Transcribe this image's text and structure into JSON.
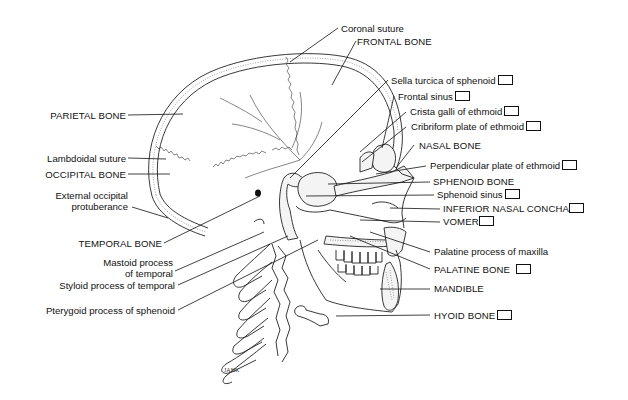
{
  "diagram": {
    "colors": {
      "ink": "#111111",
      "background": "#ffffff"
    },
    "labels_left": [
      {
        "id": "parietal",
        "text": "PARIETAL BONE",
        "caps": true,
        "checkbox": false
      },
      {
        "id": "lambdoidal",
        "text": "Lambdoidal suture",
        "caps": false,
        "checkbox": false
      },
      {
        "id": "occipital",
        "text": "OCCIPITAL BONE",
        "caps": true,
        "checkbox": false
      },
      {
        "id": "ext_occ_1",
        "text": "External occipital",
        "caps": false,
        "checkbox": false
      },
      {
        "id": "ext_occ_2",
        "text": "protuberance",
        "caps": false,
        "checkbox": false
      },
      {
        "id": "temporal",
        "text": "TEMPORAL BONE",
        "caps": true,
        "checkbox": false
      },
      {
        "id": "mastoid_1",
        "text": "Mastoid process",
        "caps": false,
        "checkbox": false
      },
      {
        "id": "mastoid_2",
        "text": "of temporal",
        "caps": false,
        "checkbox": false
      },
      {
        "id": "styloid",
        "text": "Styloid process of temporal",
        "caps": false,
        "checkbox": false
      },
      {
        "id": "pterygoid",
        "text": "Pterygoid process of sphenoid",
        "caps": false,
        "checkbox": false
      }
    ],
    "labels_right": [
      {
        "id": "coronal",
        "text": "Coronal suture",
        "caps": false,
        "checkbox": false
      },
      {
        "id": "frontal",
        "text": "FRONTAL BONE",
        "caps": true,
        "checkbox": false
      },
      {
        "id": "sella",
        "text": "Sella turcica of sphenoid",
        "caps": false,
        "checkbox": true
      },
      {
        "id": "frontal_sinus",
        "text": "Frontal sinus",
        "caps": false,
        "checkbox": true
      },
      {
        "id": "crista",
        "text": "Crista galli of ethmoid",
        "caps": false,
        "checkbox": true
      },
      {
        "id": "cribriform",
        "text": "Cribriform plate of ethmoid",
        "caps": false,
        "checkbox": true
      },
      {
        "id": "nasal",
        "text": "NASAL BONE",
        "caps": true,
        "checkbox": false
      },
      {
        "id": "perpendicular",
        "text": "Perpendicular plate of ethmoid",
        "caps": false,
        "checkbox": true
      },
      {
        "id": "sphenoid",
        "text": "SPHENOID BONE",
        "caps": true,
        "checkbox": false
      },
      {
        "id": "sphenoid_sinus",
        "text": "Sphenoid sinus",
        "caps": false,
        "checkbox": true
      },
      {
        "id": "concha",
        "text": "INFERIOR NASAL CONCHA",
        "caps": true,
        "checkbox": true
      },
      {
        "id": "vomer",
        "text": "VOMER",
        "caps": true,
        "checkbox": true
      },
      {
        "id": "palatine_process",
        "text": "Palatine process of maxilla",
        "caps": false,
        "checkbox": false
      },
      {
        "id": "palatine",
        "text": "PALATINE BONE",
        "caps": true,
        "checkbox": true
      },
      {
        "id": "mandible",
        "text": "MANDIBLE",
        "caps": true,
        "checkbox": false
      },
      {
        "id": "hyoid",
        "text": "HYOID BONE",
        "caps": true,
        "checkbox": true
      }
    ],
    "signature": "JAHK"
  }
}
